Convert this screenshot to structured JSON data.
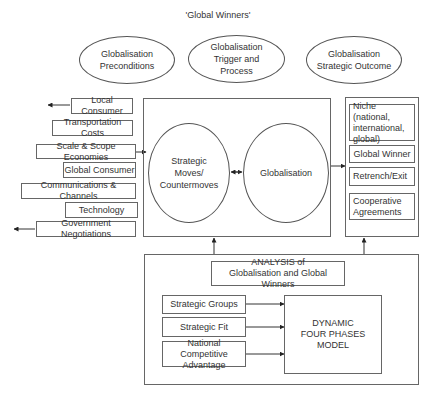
{
  "title": "'Global Winners'",
  "phases": [
    {
      "label": "Globalisation\nPreconditions"
    },
    {
      "label": "Globalisation\nTrigger and\nProcess"
    },
    {
      "label": "Globalisation\nStrategic Outcome"
    }
  ],
  "preconditions": [
    {
      "label": "Local Consumer",
      "arrow_out": true
    },
    {
      "label": "Transportation Costs"
    },
    {
      "label": "Scale & Scope Economies"
    },
    {
      "label": "Global Consumer"
    },
    {
      "label": "Communications & Channels"
    },
    {
      "label": "Technology"
    },
    {
      "label": "Government Negotiations",
      "arrow_out": true
    }
  ],
  "process": {
    "moves": "Strategic\nMoves/\nCountermoves",
    "globalisation": "Globalisation"
  },
  "outcomes": [
    {
      "label": "Niche (national,\ninternational,\nglobal)"
    },
    {
      "label": "Global Winner"
    },
    {
      "label": "Retrench/Exit"
    },
    {
      "label": "Cooperative\nAgreements"
    }
  ],
  "analysis": {
    "title": "ANALYSIS of\nGlobalisation and Global Winners",
    "inputs": [
      {
        "label": "Strategic Groups"
      },
      {
        "label": "Strategic Fit"
      },
      {
        "label": "National Competitive\nAdvantage"
      }
    ],
    "model": "DYNAMIC\nFOUR PHASES MODEL"
  }
}
